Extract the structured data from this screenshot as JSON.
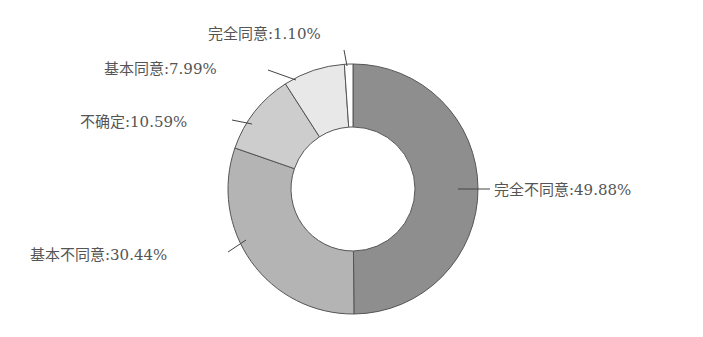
{
  "chart_data": {
    "type": "pie",
    "variant": "donut",
    "title": "",
    "categories": [
      "完全不同意",
      "基本不同意",
      "不确定",
      "基本同意",
      "完全同意"
    ],
    "values": [
      49.88,
      30.44,
      10.59,
      7.99,
      1.1
    ],
    "unit": "%",
    "labels": [
      "完全不同意:49.88%",
      "基本不同意:30.44%",
      "不确定:10.59%",
      "基本同意:7.99%",
      "完全同意:1.10%"
    ],
    "colors": [
      "#8e8e8e",
      "#b4b4b4",
      "#cdcdcd",
      "#e8e8e8",
      "#ffffff"
    ],
    "start_angle": "12 o'clock",
    "direction": "clockwise",
    "legend": "none (leader-line labels)"
  }
}
